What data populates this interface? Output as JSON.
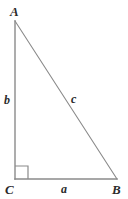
{
  "figure": {
    "type": "right-triangle-diagram",
    "background_color": "#ffffff",
    "stroke_color": "#8a8a8a",
    "label_color": "#2b2b2b",
    "vertices": {
      "A": {
        "label": "A",
        "x": 15,
        "y": 21
      },
      "B": {
        "label": "B",
        "x": 117,
        "y": 179
      },
      "C": {
        "label": "C",
        "x": 15,
        "y": 179
      }
    },
    "sides": {
      "a": {
        "label": "a",
        "between": "C-B",
        "description": "base"
      },
      "b": {
        "label": "b",
        "between": "A-C",
        "description": "vertical leg"
      },
      "c": {
        "label": "c",
        "between": "A-B",
        "description": "hypotenuse"
      }
    },
    "right_angle": {
      "at_vertex": "C",
      "marker": "square",
      "size": 13
    }
  }
}
